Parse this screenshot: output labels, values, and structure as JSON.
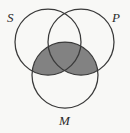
{
  "diagram": {
    "type": "three-set-venn-diagram",
    "background_color": "#f8f8f6",
    "stroke_color": "#3a3a3a",
    "shade_color": "#828282",
    "sets": [
      {
        "key": "S",
        "label": "S",
        "position": "top-left",
        "cx": 48,
        "cy": 42,
        "r": 33
      },
      {
        "key": "P",
        "label": "P",
        "position": "top-right",
        "cx": 81,
        "cy": 42,
        "r": 33
      },
      {
        "key": "M",
        "label": "M",
        "position": "bottom-center",
        "cx": 65,
        "cy": 75,
        "r": 33
      }
    ],
    "shaded_regions": [
      {
        "name": "M-intersect-S-only",
        "description": "Region inside M and S but outside P",
        "shaded": true
      },
      {
        "name": "M-intersect-P-only",
        "description": "Region inside M and P but outside S",
        "shaded": true
      },
      {
        "name": "M-intersect-S-intersect-P",
        "description": "Triple intersection of S, P and M",
        "shaded": true
      }
    ],
    "unshaded_regions": [
      {
        "name": "S-only",
        "description": "Inside S only",
        "shaded": false
      },
      {
        "name": "P-only",
        "description": "Inside P only",
        "shaded": false
      },
      {
        "name": "M-only",
        "description": "Inside M only",
        "shaded": false
      },
      {
        "name": "S-intersect-P-only",
        "description": "Inside S and P but outside M",
        "shaded": false
      }
    ],
    "shading_meaning": "M ∩ (S ∪ P) is shaded"
  }
}
